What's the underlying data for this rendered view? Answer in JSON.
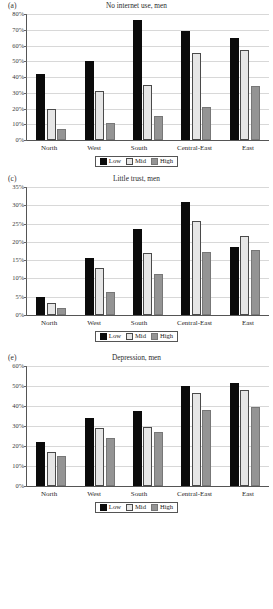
{
  "legend": {
    "items": [
      {
        "label": "Low",
        "key": "low",
        "color": "#0b0b0b"
      },
      {
        "label": "Mid",
        "key": "mid",
        "color": "#e6e6e6"
      },
      {
        "label": "High",
        "key": "high",
        "color": "#949494"
      }
    ]
  },
  "panels": [
    {
      "letter": "(a)",
      "title": "No internet use, men"
    },
    {
      "letter": "(c)",
      "title": "Little trust, men"
    },
    {
      "letter": "(e)",
      "title": "Depression, men"
    }
  ],
  "chart_data": [
    {
      "type": "bar",
      "panel": "(a)",
      "title": "No internet use, men",
      "xlabel": "",
      "ylabel": "",
      "categories": [
        "North",
        "West",
        "South",
        "Central-East",
        "East"
      ],
      "series": [
        {
          "name": "Low",
          "values": [
            42,
            50,
            76,
            69,
            65
          ]
        },
        {
          "name": "Mid",
          "values": [
            20,
            31,
            35,
            55,
            57
          ]
        },
        {
          "name": "High",
          "values": [
            7,
            11,
            15,
            21,
            34
          ]
        }
      ],
      "ylim": [
        0,
        80
      ],
      "ytick_step": 10,
      "yticks": [
        "0%",
        "10%",
        "20%",
        "30%",
        "40%",
        "50%",
        "60%",
        "70%",
        "80%"
      ],
      "grid": true,
      "legend_position": "bottom"
    },
    {
      "type": "bar",
      "panel": "(c)",
      "title": "Little trust, men",
      "xlabel": "",
      "ylabel": "",
      "categories": [
        "North",
        "West",
        "South",
        "Central-East",
        "East"
      ],
      "series": [
        {
          "name": "Low",
          "values": [
            4.8,
            15.6,
            23.5,
            30.9,
            18.6
          ]
        },
        {
          "name": "Mid",
          "values": [
            3.3,
            12.9,
            16.9,
            25.6,
            21.7
          ]
        },
        {
          "name": "High",
          "values": [
            2.0,
            6.2,
            11.3,
            17.3,
            17.9
          ]
        }
      ],
      "ylim": [
        0,
        35
      ],
      "ytick_step": 5,
      "yticks": [
        "0%",
        "5%",
        "10%",
        "15%",
        "20%",
        "25%",
        "30%",
        "35%"
      ],
      "grid": true,
      "legend_position": "bottom"
    },
    {
      "type": "bar",
      "panel": "(e)",
      "title": "Depression, men",
      "xlabel": "",
      "ylabel": "",
      "categories": [
        "North",
        "West",
        "South",
        "Central-East",
        "East"
      ],
      "series": [
        {
          "name": "Low",
          "values": [
            22.2,
            33.8,
            37.7,
            49.8,
            51.4
          ]
        },
        {
          "name": "Mid",
          "values": [
            17.2,
            29.0,
            29.4,
            46.7,
            47.9
          ]
        },
        {
          "name": "High",
          "values": [
            15.0,
            24.2,
            26.8,
            37.9,
            39.5
          ]
        }
      ],
      "ylim": [
        0,
        60
      ],
      "ytick_step": 10,
      "yticks": [
        "0%",
        "10%",
        "20%",
        "30%",
        "40%",
        "50%",
        "60%"
      ],
      "grid": true,
      "legend_position": "bottom"
    }
  ]
}
